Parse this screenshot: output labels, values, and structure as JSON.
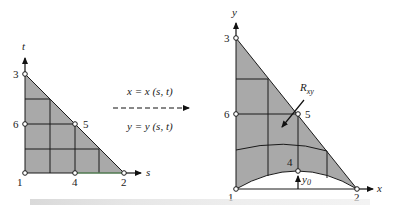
{
  "left_diagram": {
    "axis_vertical_label": "t",
    "axis_horizontal_label": "s",
    "nodes": [
      {
        "id": "1",
        "label": "1"
      },
      {
        "id": "2",
        "label": "2"
      },
      {
        "id": "3",
        "label": "3"
      },
      {
        "id": "4",
        "label": "4"
      },
      {
        "id": "5",
        "label": "5"
      },
      {
        "id": "6",
        "label": "6"
      }
    ]
  },
  "mapping": {
    "x_equation": "x = x (s, t)",
    "y_equation": "y = y (s, t)"
  },
  "right_diagram": {
    "axis_vertical_label": "y",
    "axis_horizontal_label": "x",
    "region_label_main": "R",
    "region_label_sub": "xy",
    "offset_label_main": "y",
    "offset_label_sub": "0",
    "nodes": [
      {
        "id": "1",
        "label": "1"
      },
      {
        "id": "2",
        "label": "2"
      },
      {
        "id": "3",
        "label": "3"
      },
      {
        "id": "4",
        "label": "4"
      },
      {
        "id": "5",
        "label": "5"
      },
      {
        "id": "6",
        "label": "6"
      }
    ]
  },
  "colors": {
    "fill": "#a9a9a9",
    "stroke": "#1a1a1a",
    "accent_edge": "#6aa86a"
  }
}
